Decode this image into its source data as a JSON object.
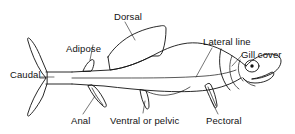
{
  "figure": {
    "style": "line-drawing",
    "colors": {
      "background": "#ffffff",
      "ink": "#111111",
      "text": "#121212"
    }
  },
  "labels": {
    "dorsal": "Dorsal",
    "adipose": "Adipose",
    "lateral_line": "Lateral line",
    "gill_cover": "Gill cover",
    "caudal": "Caudal",
    "anal": "Anal",
    "ventral_or_pelvic": "Ventral or pelvic",
    "pectoral": "Pectoral"
  },
  "parts": [
    {
      "name": "dorsal-fin",
      "label": "Dorsal"
    },
    {
      "name": "adipose-fin",
      "label": "Adipose"
    },
    {
      "name": "lateral-line",
      "label": "Lateral line"
    },
    {
      "name": "gill-cover",
      "label": "Gill cover"
    },
    {
      "name": "caudal-fin",
      "label": "Caudal"
    },
    {
      "name": "anal-fin",
      "label": "Anal"
    },
    {
      "name": "ventral-pelvic-fin",
      "label": "Ventral or pelvic"
    },
    {
      "name": "pectoral-fin",
      "label": "Pectoral"
    }
  ]
}
